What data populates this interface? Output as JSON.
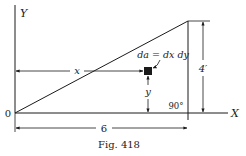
{
  "figure": {
    "caption": "Fig. 418",
    "axes": {
      "y_label": "Y",
      "x_label": "X",
      "origin_label": "0"
    },
    "element_label": "da = dx dy",
    "x_dim_label": "x",
    "y_dim_label": "y",
    "height_label": "4′",
    "base_label": "6",
    "angle_label": "90°",
    "colors": {
      "line": "#1a1a1a",
      "background": "#ffffff"
    }
  }
}
